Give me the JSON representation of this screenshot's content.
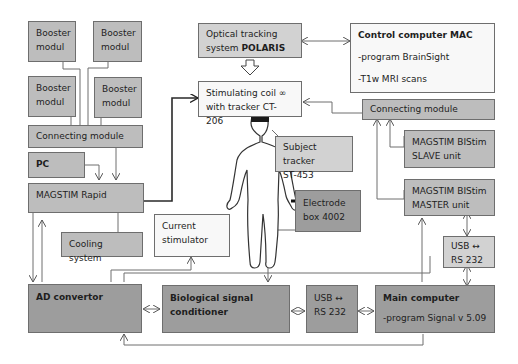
{
  "diagram": {
    "boxes": {
      "booster1": {
        "line1": "Booster",
        "line2": "modul"
      },
      "booster2": {
        "line1": "Booster",
        "line2": "modul"
      },
      "booster3": {
        "line1": "Booster",
        "line2": "modul"
      },
      "booster4": {
        "line1": "Booster",
        "line2": "modul"
      },
      "connecting_left": {
        "label": "Connecting module"
      },
      "pc": {
        "label": "PC"
      },
      "magstim_rapid": {
        "label": "MAGSTIM Rapid"
      },
      "cooling": {
        "label": "Cooling system"
      },
      "current_stimulator": {
        "line1": "Current",
        "line2": "stimulator"
      },
      "optical_tracking": {
        "line1": "Optical tracking",
        "line2_prefix": "system ",
        "line2_bold": "POLARIS"
      },
      "stimulating_coil": {
        "line1": "Stimulating coil ∞",
        "line2": "with tracker CT-206"
      },
      "subject_tracker": {
        "line1": "Subject tracker",
        "line2": "ST-453"
      },
      "electrode_box": {
        "line1": "Electrode",
        "line2": "box 4002"
      },
      "control_computer": {
        "title": "Control computer MAC",
        "line1": "-program BrainSight",
        "line2": "-T1w MRI scans"
      },
      "connecting_right": {
        "label": "Connecting module"
      },
      "bistim_slave": {
        "line1": "MAGSTIM  BIStim",
        "line2": "SLAVE unit"
      },
      "bistim_master": {
        "line1": "MAGSTIM  BIStim",
        "line2": "MASTER unit"
      },
      "usb_right": {
        "line1": "USB  ↔",
        "line2": "RS 232"
      },
      "ad_convertor": {
        "label": "AD convertor"
      },
      "bio_conditioner": {
        "line1": "Biological signal",
        "line2": "conditioner"
      },
      "usb_bottom": {
        "line1": "USB  ↔",
        "line2": "RS 232"
      },
      "main_computer": {
        "title": "Main computer",
        "line1": "-program Signal v 5.09"
      }
    },
    "icons": {
      "human_figure": "human-figure-icon",
      "hollow_down_arrow": "hollow-down-arrow-icon"
    },
    "colors": {
      "light_box": "#d2d2d2",
      "mid_box": "#bdbdbd",
      "dark_box": "#9d9d9d",
      "white_box": "#f8f8f8",
      "line": "#6e6e6e",
      "thick_line": "#2a2a2a"
    }
  }
}
